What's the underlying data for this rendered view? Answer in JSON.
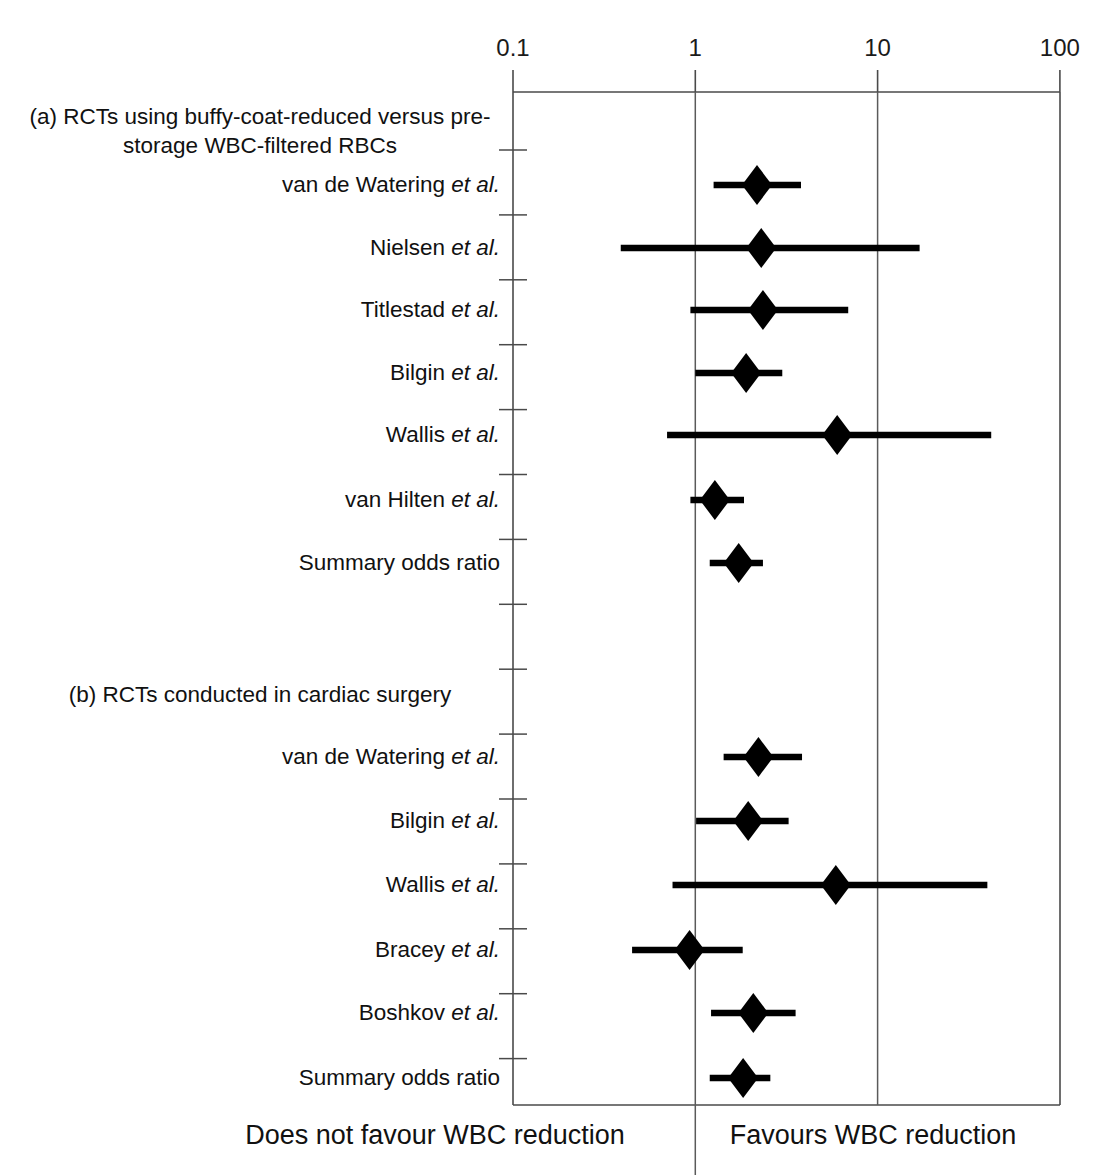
{
  "figure": {
    "axis": {
      "scale": "log",
      "ticks": [
        {
          "label": "0.1",
          "value": 0.1
        },
        {
          "label": "1",
          "value": 1
        },
        {
          "label": "10",
          "value": 10
        },
        {
          "label": "100",
          "value": 100
        }
      ],
      "gridlines": [
        1,
        10
      ]
    },
    "footer": {
      "left": "Does not favour WBC reduction",
      "right": "Favours WBC reduction"
    },
    "sections": [
      {
        "id": "a",
        "heading_line1": "(a) RCTs using buffy-coat-reduced versus pre-",
        "heading_line2": "storage WBC-filtered RBCs",
        "rows": [
          {
            "name": "van de Watering",
            "suffix": "et al.",
            "or": 2.18,
            "ci_low": 1.26,
            "ci_high": 3.8,
            "summary": false
          },
          {
            "name": "Nielsen",
            "suffix": "et al.",
            "or": 2.3,
            "ci_low": 0.39,
            "ci_high": 17.0,
            "summary": false
          },
          {
            "name": "Titlestad",
            "suffix": "et al.",
            "or": 2.35,
            "ci_low": 0.94,
            "ci_high": 6.9,
            "summary": false
          },
          {
            "name": "Bilgin",
            "suffix": "et al.",
            "or": 1.9,
            "ci_low": 1.0,
            "ci_high": 3.0,
            "summary": false
          },
          {
            "name": "Wallis",
            "suffix": "et al.",
            "or": 6.0,
            "ci_low": 0.7,
            "ci_high": 42.0,
            "summary": false
          },
          {
            "name": "van Hilten",
            "suffix": "et al.",
            "or": 1.28,
            "ci_low": 0.94,
            "ci_high": 1.85,
            "summary": false
          },
          {
            "name": "Summary odds ratio",
            "suffix": "",
            "or": 1.73,
            "ci_low": 1.2,
            "ci_high": 2.35,
            "summary": true
          }
        ]
      },
      {
        "id": "b",
        "heading_line1": "(b) RCTs conducted in cardiac surgery",
        "heading_line2": "",
        "rows": [
          {
            "name": "van de Watering",
            "suffix": "et al.",
            "or": 2.22,
            "ci_low": 1.43,
            "ci_high": 3.85,
            "summary": false
          },
          {
            "name": "Bilgin",
            "suffix": "et al.",
            "or": 1.95,
            "ci_low": 1.01,
            "ci_high": 3.25,
            "summary": false
          },
          {
            "name": "Wallis",
            "suffix": "et al.",
            "or": 5.9,
            "ci_low": 0.75,
            "ci_high": 40.0,
            "summary": false
          },
          {
            "name": "Bracey",
            "suffix": "et al.",
            "or": 0.93,
            "ci_low": 0.45,
            "ci_high": 1.82,
            "summary": false
          },
          {
            "name": "Boshkov",
            "suffix": "et al.",
            "or": 2.08,
            "ci_low": 1.22,
            "ci_high": 3.55,
            "summary": false
          },
          {
            "name": "Summary odds ratio",
            "suffix": "",
            "or": 1.83,
            "ci_low": 1.2,
            "ci_high": 2.58,
            "summary": true
          }
        ]
      }
    ]
  },
  "chart_data": {
    "type": "forest",
    "title": "",
    "xlabel": "Odds ratio (log scale)",
    "ylabel": "",
    "xscale": "log",
    "xlim": [
      0.1,
      100
    ],
    "xticks": [
      0.1,
      1,
      10,
      100
    ],
    "xticklabels": [
      "0.1",
      "1",
      "10",
      "100"
    ],
    "reference_line": 1,
    "gridlines": [
      1,
      10
    ],
    "annotations": [
      "Does not favour WBC reduction",
      "Favours WBC reduction"
    ],
    "groups": [
      {
        "label": "(a) RCTs using buffy-coat-reduced versus pre-storage WBC-filtered RBCs",
        "points": [
          {
            "study": "van de Watering et al.",
            "odds_ratio": 2.18,
            "ci_lower": 1.26,
            "ci_upper": 3.8
          },
          {
            "study": "Nielsen et al.",
            "odds_ratio": 2.3,
            "ci_lower": 0.39,
            "ci_upper": 17.0
          },
          {
            "study": "Titlestad et al.",
            "odds_ratio": 2.35,
            "ci_lower": 0.94,
            "ci_upper": 6.9
          },
          {
            "study": "Bilgin et al.",
            "odds_ratio": 1.9,
            "ci_lower": 1.0,
            "ci_upper": 3.0
          },
          {
            "study": "Wallis et al.",
            "odds_ratio": 6.0,
            "ci_lower": 0.7,
            "ci_upper": 42.0
          },
          {
            "study": "van Hilten et al.",
            "odds_ratio": 1.28,
            "ci_lower": 0.94,
            "ci_upper": 1.85
          },
          {
            "study": "Summary odds ratio",
            "odds_ratio": 1.73,
            "ci_lower": 1.2,
            "ci_upper": 2.35
          }
        ]
      },
      {
        "label": "(b) RCTs conducted in cardiac surgery",
        "points": [
          {
            "study": "van de Watering et al.",
            "odds_ratio": 2.22,
            "ci_lower": 1.43,
            "ci_upper": 3.85
          },
          {
            "study": "Bilgin et al.",
            "odds_ratio": 1.95,
            "ci_lower": 1.01,
            "ci_upper": 3.25
          },
          {
            "study": "Wallis et al.",
            "odds_ratio": 5.9,
            "ci_lower": 0.75,
            "ci_upper": 40.0
          },
          {
            "study": "Bracey et al.",
            "odds_ratio": 0.93,
            "ci_lower": 0.45,
            "ci_upper": 1.82
          },
          {
            "study": "Boshkov et al.",
            "odds_ratio": 2.08,
            "ci_lower": 1.22,
            "ci_upper": 3.55
          },
          {
            "study": "Summary odds ratio",
            "odds_ratio": 1.83,
            "ci_lower": 1.2,
            "ci_upper": 2.58
          }
        ]
      }
    ]
  }
}
